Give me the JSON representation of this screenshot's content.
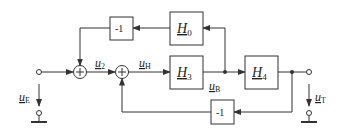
{
  "diagram": {
    "blocks": {
      "h0": {
        "name": "H",
        "sub": "0"
      },
      "h3": {
        "name": "H",
        "sub": "3"
      },
      "h4": {
        "name": "H",
        "sub": "4"
      },
      "neg_top": {
        "label": "-1"
      },
      "neg_bottom": {
        "label": "-1"
      }
    },
    "summing_junction_symbol": "+",
    "signals": {
      "u2": {
        "name": "u",
        "sub": "2"
      },
      "uH": {
        "name": "u",
        "sub": "H"
      },
      "uB": {
        "name": "u",
        "sub": "B"
      },
      "uE": {
        "name": "u",
        "sub": "E"
      },
      "uT": {
        "name": "u",
        "sub": "T"
      }
    },
    "colors": {
      "line": "#333333",
      "background": "#ffffff"
    }
  }
}
